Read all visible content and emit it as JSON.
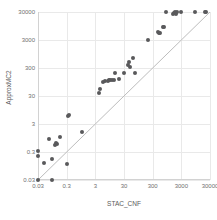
{
  "chart_data": {
    "type": "scatter",
    "title": "",
    "xlabel": "STAC_CNF",
    "ylabel": "ApproxMC2",
    "xscale": "log",
    "yscale": "log",
    "xlim": [
      0.03,
      30000
    ],
    "ylim": [
      0.03,
      30000
    ],
    "grid": true,
    "legend": "none",
    "xticks": [
      "0.03",
      "0.3",
      "3",
      "30",
      "300",
      "3000",
      "30000"
    ],
    "xtick_values": [
      0.03,
      0.3,
      3,
      30,
      300,
      3000,
      30000
    ],
    "yticks": [
      "0.03",
      "0.3",
      "3",
      "30",
      "300",
      "3000",
      "30000"
    ],
    "ytick_values": [
      0.03,
      0.3,
      3,
      30,
      300,
      3000,
      30000
    ],
    "reference_line": {
      "name": "y = x diagonal",
      "from": [
        0.03,
        0.03
      ],
      "to": [
        30000,
        30000
      ],
      "color": "#bdbdbd"
    },
    "series": [
      {
        "name": "instances",
        "marker": "circle",
        "color": "#59595b",
        "points": [
          [
            0.03,
            0.03
          ],
          [
            0.03,
            0.22
          ],
          [
            0.03,
            0.32
          ],
          [
            0.05,
            0.12
          ],
          [
            0.07,
            0.9
          ],
          [
            0.09,
            0.03
          ],
          [
            0.09,
            0.17
          ],
          [
            0.12,
            0.55
          ],
          [
            0.13,
            0.62
          ],
          [
            0.14,
            0.6
          ],
          [
            0.17,
            1.0
          ],
          [
            0.3,
            0.11
          ],
          [
            0.33,
            6.0
          ],
          [
            0.35,
            6.5
          ],
          [
            1.0,
            1.5
          ],
          [
            4.0,
            40.0
          ],
          [
            4.3,
            52.0
          ],
          [
            5.5,
            95.0
          ],
          [
            6.5,
            100.0
          ],
          [
            8.0,
            105.0
          ],
          [
            9.0,
            110.0
          ],
          [
            9.5,
            108.0
          ],
          [
            11.0,
            112.0
          ],
          [
            13.0,
            115.0
          ],
          [
            14.0,
            200.0
          ],
          [
            20.0,
            118.0
          ],
          [
            30.0,
            200.0
          ],
          [
            40.0,
            400.0
          ],
          [
            45.0,
            500.0
          ],
          [
            50.0,
            330.0
          ],
          [
            60.0,
            700.0
          ],
          [
            75.0,
            200.0
          ],
          [
            200.0,
            3000.0
          ],
          [
            450.0,
            6000.0
          ],
          [
            500.0,
            5500.0
          ],
          [
            520.0,
            5200.0
          ],
          [
            700.0,
            9000.0
          ],
          [
            750.0,
            8500.0
          ],
          [
            900.0,
            30000.0
          ],
          [
            1500.0,
            25000.0
          ],
          [
            1700.0,
            28000.0
          ],
          [
            1800.0,
            30000.0
          ],
          [
            2000.0,
            26000.0
          ],
          [
            2100.0,
            30000.0
          ],
          [
            3000.0,
            30000.0
          ],
          [
            9000.0,
            30000.0
          ],
          [
            20000.0,
            30000.0
          ],
          [
            22000.0,
            30000.0
          ]
        ]
      }
    ]
  }
}
